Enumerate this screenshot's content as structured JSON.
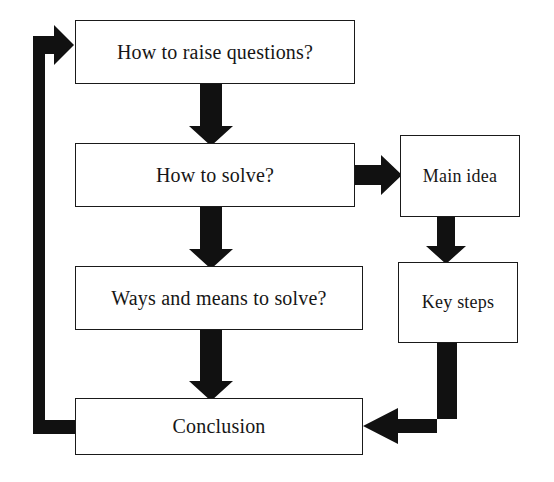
{
  "diagram": {
    "type": "flowchart",
    "background_color": "#ffffff",
    "line_color": "#111111",
    "box_border_color": "#1a1a1a",
    "box_fill_color": "#ffffff",
    "text_color": "#161616"
  },
  "nodes": [
    {
      "id": "raise_questions",
      "label": "How to raise questions?",
      "shape": "rectangle",
      "x": 75,
      "y": 20,
      "width": 280,
      "height": 64
    },
    {
      "id": "how_to_solve",
      "label": "How to solve?",
      "shape": "rectangle",
      "x": 75,
      "y": 143,
      "width": 280,
      "height": 64
    },
    {
      "id": "ways_means",
      "label": "Ways and means to solve?",
      "shape": "rectangle",
      "x": 75,
      "y": 266,
      "width": 288,
      "height": 64
    },
    {
      "id": "conclusion",
      "label": "Conclusion",
      "shape": "rectangle",
      "x": 75,
      "y": 398,
      "width": 288,
      "height": 57
    },
    {
      "id": "main_idea",
      "label": "Main idea",
      "shape": "rectangle",
      "x": 400,
      "y": 135,
      "width": 120,
      "height": 82
    },
    {
      "id": "key_steps",
      "label": "Key steps",
      "shape": "rectangle",
      "x": 398,
      "y": 262,
      "width": 120,
      "height": 81
    }
  ],
  "edges": [
    {
      "id": "e1",
      "from": "raise_questions",
      "to": "how_to_solve",
      "direction": "down",
      "label": ""
    },
    {
      "id": "e2",
      "from": "how_to_solve",
      "to": "ways_means",
      "direction": "down",
      "label": ""
    },
    {
      "id": "e3",
      "from": "ways_means",
      "to": "conclusion",
      "direction": "down",
      "label": ""
    },
    {
      "id": "e4",
      "from": "how_to_solve",
      "to": "main_idea",
      "direction": "right",
      "label": ""
    },
    {
      "id": "e5",
      "from": "main_idea",
      "to": "key_steps",
      "direction": "down",
      "label": ""
    },
    {
      "id": "e6",
      "from": "key_steps",
      "to": "conclusion",
      "direction": "down-then-left",
      "label": ""
    },
    {
      "id": "e7",
      "from": "conclusion",
      "to": "raise_questions",
      "direction": "left-up-then-right",
      "label": ""
    }
  ]
}
